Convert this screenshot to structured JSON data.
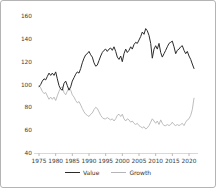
{
  "window": {
    "background": "#ffffff",
    "border_color": "#b4b4b4"
  },
  "chart_data": {
    "type": "line",
    "title": "",
    "xlabel": "",
    "ylabel": "",
    "grid": false,
    "legend_position": "bottom",
    "x_start": 1975,
    "x_step": 0.5,
    "xlim": [
      1974.5,
      2022.5
    ],
    "ylim": [
      40,
      160
    ],
    "x_ticks": [
      1975,
      1980,
      1985,
      1990,
      1995,
      2000,
      2005,
      2010,
      2015,
      2020
    ],
    "y_ticks": [
      40,
      60,
      80,
      100,
      120,
      140,
      160
    ],
    "axis_color": "#cfcfcf",
    "tick_color": "#8a8a8a",
    "label_color": "#3a3a3a",
    "series": [
      {
        "name": "Value",
        "color": "#2b2b2b",
        "values": [
          98,
          100,
          103,
          105,
          104,
          107,
          110,
          108,
          110,
          108,
          111,
          105,
          99,
          96,
          95,
          101,
          103,
          99,
          95,
          98,
          103,
          106,
          109,
          111,
          110,
          114,
          119,
          123,
          126,
          127,
          129,
          126,
          124,
          119,
          116,
          117,
          121,
          125,
          128,
          130,
          131,
          129,
          131,
          132,
          130,
          133,
          129,
          124,
          122,
          125,
          120,
          127,
          131,
          128,
          130,
          133,
          131,
          135,
          137,
          136,
          139,
          142,
          146,
          144,
          149,
          147,
          143,
          136,
          123,
          131,
          134,
          131,
          136,
          128,
          124,
          127,
          130,
          133,
          136,
          137,
          138,
          133,
          127,
          130,
          131,
          133,
          134,
          130,
          127,
          129,
          125,
          122,
          118,
          114
        ]
      },
      {
        "name": "Growth",
        "color": "#b5b5b5",
        "values": [
          99,
          97,
          94,
          92,
          93,
          90,
          87,
          89,
          87,
          89,
          86,
          90,
          94,
          97,
          98,
          93,
          91,
          94,
          97,
          95,
          91,
          89,
          86,
          84,
          85,
          82,
          79,
          76,
          74,
          73,
          72,
          74,
          75,
          78,
          80,
          79,
          76,
          73,
          71,
          70,
          70,
          71,
          70,
          69,
          70,
          68,
          70,
          73,
          74,
          72,
          74,
          70,
          68,
          70,
          69,
          67,
          68,
          66,
          65,
          66,
          64,
          63,
          62,
          63,
          61,
          62,
          64,
          67,
          70,
          68,
          66,
          68,
          65,
          69,
          66,
          64,
          64,
          65,
          64,
          65,
          67,
          65,
          64,
          65,
          64,
          65,
          66,
          64,
          67,
          69,
          70,
          73,
          78,
          88
        ]
      }
    ]
  }
}
